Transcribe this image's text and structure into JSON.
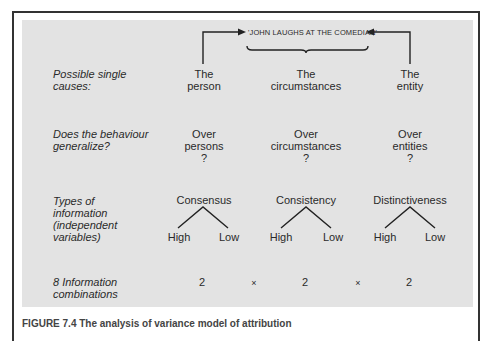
{
  "figure": {
    "statement": "'JOHN LAUGHS AT THE COMEDIAN'",
    "rows": {
      "causes": {
        "label_lines": [
          "Possible single",
          "causes:"
        ],
        "items": [
          {
            "lines": [
              "The",
              "person"
            ]
          },
          {
            "lines": [
              "The",
              "circumstances"
            ]
          },
          {
            "lines": [
              "The",
              "entity"
            ]
          }
        ]
      },
      "generalize": {
        "label_lines": [
          "Does the behaviour",
          "generalize?"
        ],
        "items": [
          {
            "lines": [
              "Over",
              "persons",
              "?"
            ]
          },
          {
            "lines": [
              "Over",
              "circumstances",
              "?"
            ]
          },
          {
            "lines": [
              "Over",
              "entities",
              "?"
            ]
          }
        ]
      },
      "information": {
        "label_lines": [
          "Types of",
          "information",
          "(independent",
          "variables)"
        ],
        "items": [
          {
            "name": "Consensus",
            "high": "High",
            "low": "Low"
          },
          {
            "name": "Consistency",
            "high": "High",
            "low": "Low"
          },
          {
            "name": "Distinctiveness",
            "high": "High",
            "low": "Low"
          }
        ]
      },
      "combinations": {
        "label_lines": [
          "8 Information",
          "combinations"
        ],
        "values": [
          "2",
          "2",
          "2"
        ],
        "operator": "×"
      }
    },
    "caption": "FIGURE 7.4 The analysis of variance model of attribution"
  }
}
